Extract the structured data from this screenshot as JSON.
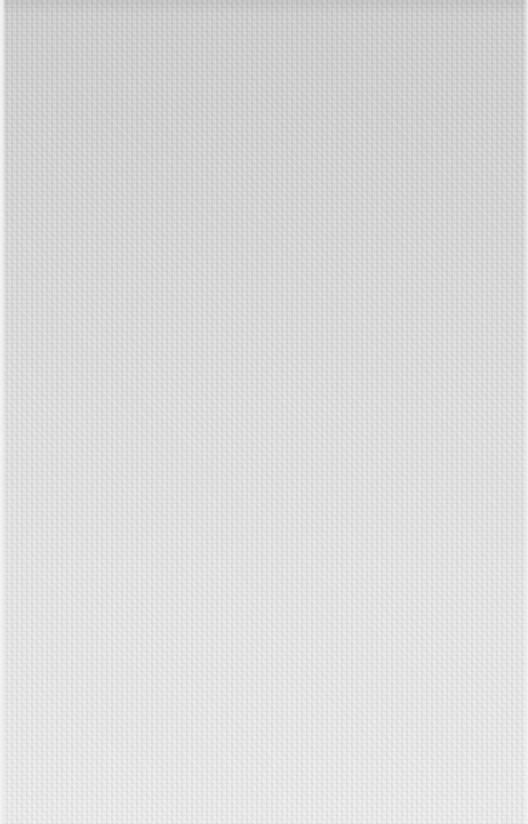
{
  "surface": {
    "description": "blank textured paper",
    "colors": {
      "top": "#cdcdcd",
      "middle": "#e0e0e0",
      "bottom": "#ececec",
      "left_edge": "#f4f4f4"
    }
  }
}
